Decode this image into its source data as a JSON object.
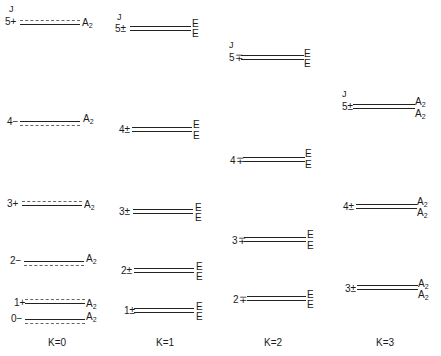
{
  "columns": [
    {
      "k_label": "K=0",
      "j_header": "J",
      "levels": [
        {
          "j": "5",
          "parity": "+",
          "sym": "A",
          "sub": "2"
        },
        {
          "j": "4",
          "parity": "−",
          "sym": "A",
          "sub": "2"
        },
        {
          "j": "3",
          "parity": "+",
          "sym": "A",
          "sub": "2"
        },
        {
          "j": "2",
          "parity": "−",
          "sym": "A",
          "sub": "2"
        },
        {
          "j": "1",
          "parity": "+",
          "sym": "A",
          "sub": "2"
        },
        {
          "j": "0",
          "parity": "−",
          "sym": "A",
          "sub": "2"
        }
      ]
    },
    {
      "k_label": "K=1",
      "j_header": "J",
      "levels": [
        {
          "j": "5",
          "parity": "±",
          "sym_top": "E",
          "sym_bottom": "E"
        },
        {
          "j": "4",
          "parity": "±",
          "sym_top": "E",
          "sym_bottom": "E"
        },
        {
          "j": "3",
          "parity": "±",
          "sym_top": "E",
          "sym_bottom": "E"
        },
        {
          "j": "2",
          "parity": "±",
          "sym_top": "E",
          "sym_bottom": "E"
        },
        {
          "j": "1",
          "parity": "±",
          "sym_top": "E",
          "sym_bottom": "E"
        }
      ]
    },
    {
      "k_label": "K=2",
      "j_header": "J",
      "levels": [
        {
          "j": "5",
          "parity": "∓",
          "sym_top": "E",
          "sym_bottom": "E"
        },
        {
          "j": "4",
          "parity": "∓",
          "sym_top": "E",
          "sym_bottom": "E"
        },
        {
          "j": "3",
          "parity": "∓",
          "sym_top": "E",
          "sym_bottom": "E"
        },
        {
          "j": "2",
          "parity": "∓",
          "sym_top": "E",
          "sym_bottom": "E"
        }
      ]
    },
    {
      "k_label": "K=3",
      "j_header": "J",
      "levels": [
        {
          "j": "5",
          "parity": "±",
          "sym_top": "A",
          "sub_top": "2",
          "sym_bottom": "A",
          "sub_bottom": "2"
        },
        {
          "j": "4",
          "parity": "±",
          "sym_top": "A",
          "sub_top": "2",
          "sym_bottom": "A",
          "sub_bottom": "2"
        },
        {
          "j": "3",
          "parity": "±",
          "sym_top": "A",
          "sub_top": "2",
          "sym_bottom": "A",
          "sub_bottom": "2"
        }
      ]
    }
  ]
}
